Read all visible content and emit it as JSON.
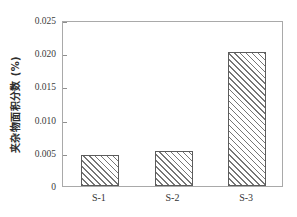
{
  "chart_data": {
    "type": "bar",
    "title": "",
    "subtitle": "",
    "xlabel": "",
    "ylabel": "夹杂物面积分数 (%)",
    "categories": [
      "S-1",
      "S-2",
      "S-3"
    ],
    "values": [
      0.0046,
      0.0052,
      0.0202
    ],
    "series": [
      {
        "name": "夹杂物面积分数",
        "values": [
          0.0046,
          0.0052,
          0.0202
        ]
      }
    ],
    "ylim": [
      0,
      0.025
    ],
    "xlim": [
      0,
      3
    ],
    "yticks": [
      0,
      0.005,
      0.01,
      0.015,
      0.02,
      0.025
    ],
    "ytick_labels": [
      "0",
      "0.005",
      "0.010",
      "0.015",
      "0.020",
      "0.025"
    ],
    "xtick_labels": [
      "S-1",
      "S-2",
      "S-3"
    ],
    "grid": false,
    "legend": null,
    "legend_position": "none",
    "annotations": [],
    "bar_fill": "hatched-diagonal",
    "bar_edge_color": "#5c5c5c",
    "hatch_color": "#767676",
    "frame_color": "#a9a9a9",
    "background_color": "#ffffff"
  }
}
